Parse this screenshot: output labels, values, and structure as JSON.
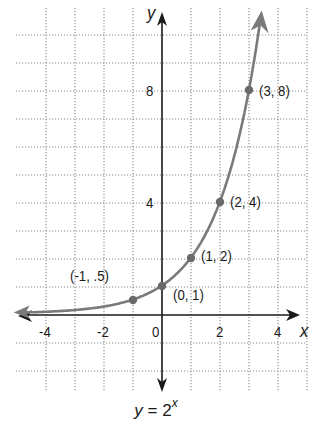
{
  "chart_data": {
    "type": "line",
    "caption": {
      "lhs": "y",
      "eq": " = ",
      "base": "2",
      "exponent": "x"
    },
    "xlabel": "x",
    "ylabel": "y",
    "xlim": [
      -5,
      5
    ],
    "ylim": [
      -3,
      10
    ],
    "grid": true,
    "x_ticks": [
      -4,
      -2,
      0,
      2,
      4
    ],
    "x_tick_labels": [
      "-4",
      "-2",
      "0",
      "2",
      "4"
    ],
    "y_ticks": [
      4,
      8
    ],
    "y_tick_labels": [
      "4",
      "8"
    ],
    "series": [
      {
        "name": "y = 2^x",
        "function": "2^x",
        "x": [
          -1,
          0,
          1,
          2,
          3
        ],
        "y": [
          0.5,
          1,
          2,
          4,
          8
        ],
        "point_labels": [
          "(-1, .5)",
          "(0, 1)",
          "(1, 2)",
          "(2, 4)",
          "(3, 8)"
        ],
        "color": "#7a7a7a"
      }
    ],
    "axis_color": "#1a1a1a",
    "grid_color": "#8a8a8a"
  }
}
